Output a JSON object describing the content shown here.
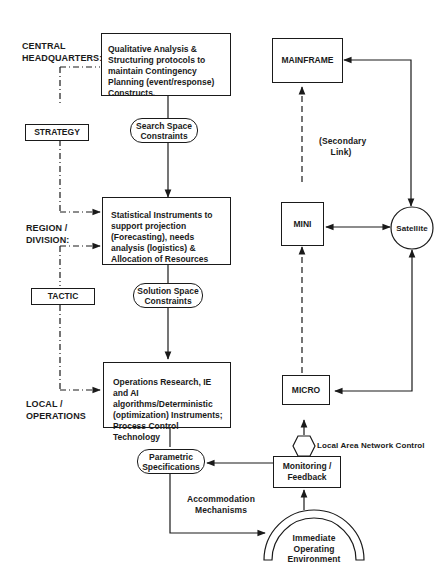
{
  "levels": {
    "central": "CENTRAL\nHEADQUARTERS:",
    "central_line1": "CENTRAL",
    "central_line2": "HEADQUARTERS:",
    "region_line1": "REGION /",
    "region_line2": "DIVISION:",
    "local_line1": "LOCAL /",
    "local_line2": "OPERATIONS"
  },
  "side_boxes": {
    "strategy": "STRATEGY",
    "tactic": "TACTIC"
  },
  "main_boxes": {
    "qualitative": "Qualitative Analysis & Structuring protocols to maintain Contingency Planning (event/response) Constructs.",
    "statistical": "Statistical Instruments to support projection (Forecasting), needs analysis (logistics) & Allocation of Resources",
    "operations": "Operations Research, IE and AI algorithms/Deterministic (optimization) Instruments; Process Control Technology"
  },
  "constraints": {
    "search_line1": "Search Space",
    "search_line2": "Constraints",
    "solution_line1": "Solution Space",
    "solution_line2": "Constraints",
    "parametric_line1": "Parametric",
    "parametric_line2": "Specifications"
  },
  "computers": {
    "mainframe": "MAINFRAME",
    "mini": "MINI",
    "micro": "MICRO",
    "satellite": "Satellite"
  },
  "labels": {
    "secondary_line1": "(Secondary",
    "secondary_line2": "Link)",
    "lan": "Local Area Network Control",
    "monitoring_line1": "Monitoring /",
    "monitoring_line2": "Feedback",
    "accommodation_line1": "Accommodation",
    "accommodation_line2": "Mechanisms",
    "environment_line1": "Immediate",
    "environment_line2": "Operating",
    "environment_line3": "Environment"
  }
}
